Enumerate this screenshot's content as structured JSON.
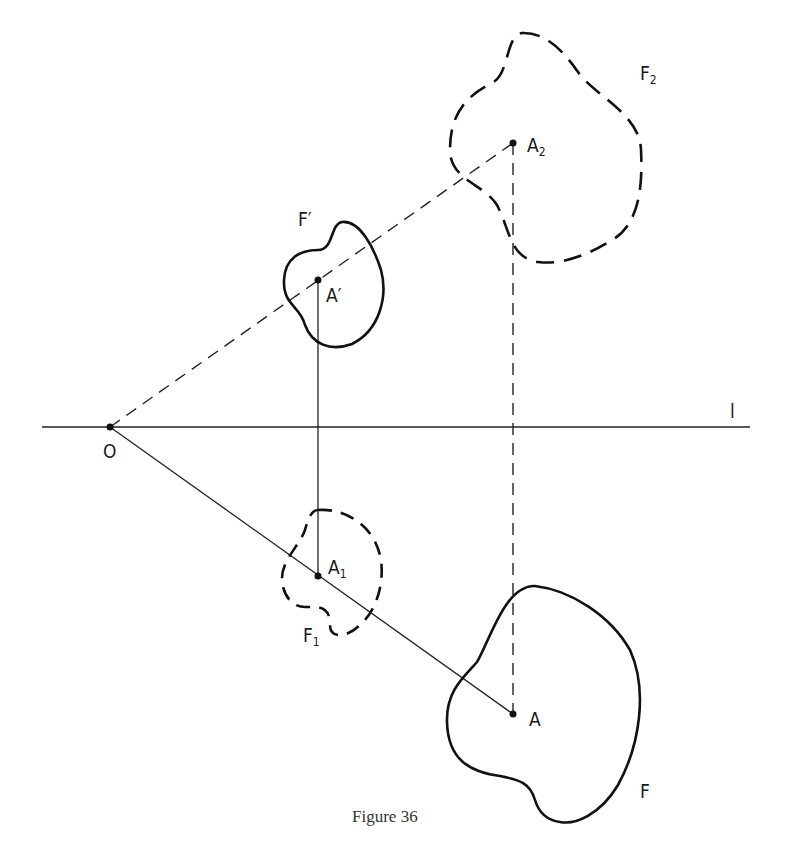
{
  "figure": {
    "caption": "Figure 36",
    "line_label": "l",
    "origin_label": "O",
    "points": {
      "A": {
        "label": "A",
        "sub": ""
      },
      "A_prime": {
        "label": "A′",
        "sub": ""
      },
      "A1": {
        "label": "A",
        "sub": "1"
      },
      "A2": {
        "label": "A",
        "sub": "2"
      }
    },
    "figures": {
      "F": {
        "label": "F",
        "sub": ""
      },
      "F_prime": {
        "label": "F′",
        "sub": ""
      },
      "F1": {
        "label": "F",
        "sub": "1"
      },
      "F2": {
        "label": "F",
        "sub": "2"
      }
    }
  }
}
